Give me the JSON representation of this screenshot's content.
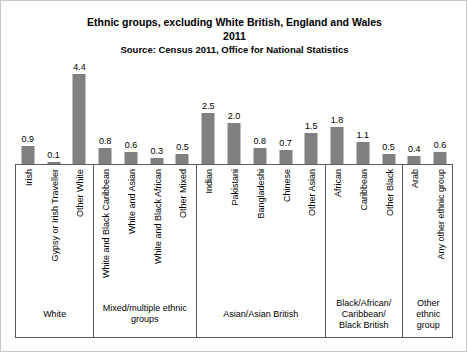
{
  "chart": {
    "title_line1": "Ethnic groups, excluding White British, England and Wales",
    "title_line2": "2011",
    "source": "Source: Census 2011, Office for National Statistics"
  },
  "chart_data": {
    "type": "bar",
    "title": "Ethnic groups, excluding White British, England and Wales 2011",
    "subtitle": "Source: Census 2011, Office for National Statistics",
    "xlabel": "",
    "ylabel": "",
    "ylim": [
      0,
      4.4
    ],
    "grid": false,
    "legend": "none",
    "bar_color": "#808080",
    "categories": [
      "Irish",
      "Gypsy or Irish Traveller",
      "Other White",
      "White and Black Caribbean",
      "White and Asian",
      "White and Black African",
      "Other Mixed",
      "Indian",
      "Pakistani",
      "Bangladeshi",
      "Chinese",
      "Other Asian",
      "African",
      "Caribbean",
      "Other Black",
      "Arab",
      "Any other ethnic group"
    ],
    "values": [
      0.9,
      0.1,
      4.4,
      0.8,
      0.6,
      0.3,
      0.5,
      2.5,
      2.0,
      0.8,
      0.7,
      1.5,
      1.8,
      1.1,
      0.5,
      0.4,
      0.6
    ],
    "groups": [
      {
        "label": "White",
        "start": 0,
        "end": 2
      },
      {
        "label": "Mixed/multiple ethnic groups",
        "start": 3,
        "end": 6
      },
      {
        "label": "Asian/Asian British",
        "start": 7,
        "end": 11
      },
      {
        "label": "Black/African/ Caribbean/ Black British",
        "start": 12,
        "end": 14
      },
      {
        "label": "Other ethnic group",
        "start": 15,
        "end": 16
      }
    ],
    "group_labels_wrapped": [
      [
        "White"
      ],
      [
        "Mixed/multiple ethnic",
        "groups"
      ],
      [
        "Asian/Asian British"
      ],
      [
        "Black/African/",
        "Caribbean/",
        "Black British"
      ],
      [
        "Other",
        "ethnic",
        "group"
      ]
    ]
  }
}
